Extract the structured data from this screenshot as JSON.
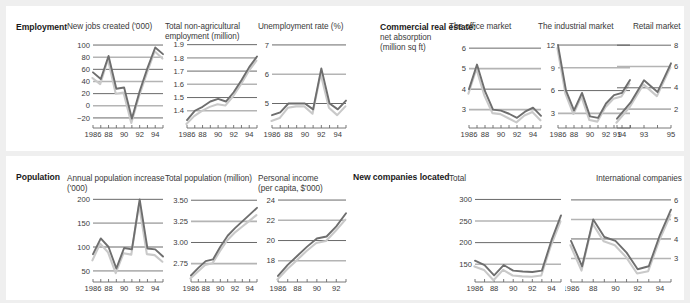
{
  "page": {
    "background": "#efefef",
    "panel_background": "#ffffff",
    "line_color": "#6e6e6e",
    "shadow_color": "#c9c9c9"
  },
  "sections": {
    "employment": {
      "label": "Employment"
    },
    "commercial": {
      "label": "Commercial real estate:",
      "sub1": "net absorption",
      "sub2": "(million sq ft)"
    },
    "population": {
      "label": "Population"
    },
    "companies": {
      "label": "New companies located"
    }
  },
  "chart_data": [
    {
      "id": "new-jobs-created",
      "type": "line",
      "title": "New jobs created ('000)",
      "title_lines": [
        "New jobs created ('000)"
      ],
      "x": [
        1986,
        1987,
        1988,
        1989,
        1990,
        1991,
        1992,
        1993,
        1994,
        1995
      ],
      "xtick_labels": [
        "1986",
        "88",
        "90",
        "92",
        "94"
      ],
      "xtick_values": [
        1986,
        1988,
        1990,
        1992,
        1994
      ],
      "ytick_labels": [
        "100",
        "80",
        "60",
        "40",
        "20",
        "0",
        "−20"
      ],
      "ytick_values": [
        100,
        80,
        60,
        40,
        20,
        0,
        -20
      ],
      "ylim": [
        -30,
        105
      ],
      "grid": true,
      "series": [
        {
          "name": "main",
          "values": [
            55,
            44,
            82,
            28,
            30,
            -21,
            24,
            62,
            96,
            85
          ]
        },
        {
          "name": "shadow",
          "values": [
            48,
            38,
            79,
            22,
            24,
            -26,
            18,
            56,
            92,
            80
          ]
        }
      ]
    },
    {
      "id": "total-non-agricultural-employment",
      "type": "line",
      "title": "Total non-agricultural employment (million)",
      "title_lines": [
        "Total non-agricultural",
        "employment (million)"
      ],
      "x": [
        1986,
        1987,
        1988,
        1989,
        1990,
        1991,
        1992,
        1993,
        1994,
        1995
      ],
      "xtick_labels": [
        "1986",
        "88",
        "90",
        "92",
        "94"
      ],
      "xtick_values": [
        1986,
        1988,
        1990,
        1992,
        1994
      ],
      "ytick_labels": [
        "1.9",
        "1.8",
        "1.7",
        "1.6",
        "1.5",
        "1.4"
      ],
      "ytick_values": [
        1.9,
        1.8,
        1.7,
        1.6,
        1.5,
        1.4
      ],
      "ylim": [
        1.3,
        1.92
      ],
      "grid": true,
      "series": [
        {
          "name": "main",
          "values": [
            1.33,
            1.4,
            1.43,
            1.47,
            1.49,
            1.47,
            1.54,
            1.63,
            1.73,
            1.81
          ]
        },
        {
          "name": "shadow",
          "values": [
            1.31,
            1.37,
            1.41,
            1.44,
            1.46,
            1.45,
            1.52,
            1.61,
            1.71,
            1.79
          ]
        }
      ]
    },
    {
      "id": "unemployment-rate",
      "type": "line",
      "title": "Unemployment rate (%)",
      "title_lines": [
        "Unemployment rate (%)"
      ],
      "x": [
        1986,
        1987,
        1988,
        1989,
        1990,
        1991,
        1992,
        1993,
        1994,
        1995
      ],
      "xtick_labels": [
        "1986",
        "88",
        "90",
        "92",
        "94"
      ],
      "xtick_values": [
        1986,
        1988,
        1990,
        1992,
        1994
      ],
      "ytick_labels": [
        "7",
        "6",
        "5"
      ],
      "ytick_values": [
        7,
        6,
        5
      ],
      "ylim": [
        4.3,
        7.1
      ],
      "grid": true,
      "series": [
        {
          "name": "main",
          "values": [
            4.6,
            4.7,
            5.0,
            5.0,
            5.0,
            4.8,
            6.2,
            5.0,
            4.8,
            5.1
          ]
        },
        {
          "name": "shadow",
          "values": [
            4.45,
            4.55,
            4.9,
            4.95,
            4.95,
            4.7,
            6.05,
            4.9,
            4.65,
            4.95
          ]
        }
      ]
    },
    {
      "id": "office-market",
      "type": "line",
      "title": "The office market",
      "title_lines": [
        "The office market"
      ],
      "x": [
        1986,
        1987,
        1988,
        1989,
        1990,
        1991,
        1992,
        1993,
        1994,
        1995
      ],
      "xtick_labels": [
        "1986",
        "88",
        "90",
        "92",
        "94"
      ],
      "xtick_values": [
        1986,
        1988,
        1990,
        1992,
        1994
      ],
      "ytick_labels": [
        "6",
        "5",
        "4",
        "3"
      ],
      "ytick_values": [
        6,
        5,
        4,
        3
      ],
      "ylim": [
        2.3,
        6.3
      ],
      "grid": true,
      "series": [
        {
          "name": "main",
          "values": [
            4.0,
            5.2,
            3.9,
            3.0,
            2.95,
            2.8,
            2.6,
            2.9,
            3.1,
            2.7
          ]
        },
        {
          "name": "shadow",
          "values": [
            3.85,
            5.05,
            3.75,
            2.9,
            2.85,
            2.65,
            2.45,
            2.78,
            2.95,
            2.55
          ]
        }
      ]
    },
    {
      "id": "industrial-market",
      "type": "line",
      "title": "The industrial market",
      "title_lines": [
        "The industrial market"
      ],
      "x": [
        1986,
        1987,
        1988,
        1989,
        1990,
        1991,
        1992,
        1993,
        1994,
        1995
      ],
      "xtick_labels": [
        "1986",
        "88",
        "90",
        "92",
        "94"
      ],
      "xtick_values": [
        1986,
        1988,
        1990,
        1992,
        1994
      ],
      "ytick_labels": [
        "12",
        "9",
        "6",
        "3"
      ],
      "ytick_values": [
        12,
        9,
        6,
        3
      ],
      "ylim": [
        1.6,
        12.4
      ],
      "grid": true,
      "series": [
        {
          "name": "main",
          "values": [
            12.0,
            6.0,
            3.4,
            5.7,
            2.6,
            2.4,
            4.3,
            5.4,
            5.7,
            7.4
          ]
        },
        {
          "name": "shadow",
          "values": [
            11.8,
            5.8,
            3.1,
            5.4,
            2.3,
            2.1,
            4.0,
            5.1,
            5.4,
            7.1
          ]
        }
      ]
    },
    {
      "id": "retail-market",
      "type": "line",
      "title": "Retail market",
      "title_lines": [
        "Retail market"
      ],
      "x": [
        1991,
        1992,
        1993,
        1994,
        1995
      ],
      "xtick_labels": [
        "91",
        "93",
        "95"
      ],
      "xtick_values": [
        1991,
        1993,
        1995
      ],
      "ytick_labels": [
        "8",
        "6",
        "4",
        "2"
      ],
      "ytick_values": [
        8,
        6,
        4,
        2
      ],
      "ylim": [
        0.6,
        8.3
      ],
      "grid": true,
      "grid_right": true,
      "series": [
        {
          "name": "main",
          "values": [
            1.1,
            2.6,
            4.7,
            3.6,
            6.3
          ]
        },
        {
          "name": "shadow",
          "values": [
            0.85,
            2.35,
            4.45,
            3.35,
            6.05
          ]
        }
      ]
    },
    {
      "id": "annual-population-increase",
      "type": "line",
      "title": "Annual population increase ('000)",
      "title_lines": [
        "Annual population increase",
        "('000)"
      ],
      "x": [
        1986,
        1987,
        1988,
        1989,
        1990,
        1991,
        1992,
        1993,
        1994,
        1995
      ],
      "xtick_labels": [
        "1986",
        "88",
        "90",
        "92",
        "94"
      ],
      "xtick_values": [
        1986,
        1988,
        1990,
        1992,
        1994
      ],
      "ytick_labels": [
        "200",
        "150",
        "100",
        "50"
      ],
      "ytick_values": [
        200,
        150,
        100,
        50
      ],
      "ylim": [
        35,
        207
      ],
      "grid": true,
      "series": [
        {
          "name": "main",
          "values": [
            85,
            118,
            100,
            55,
            98,
            95,
            200,
            97,
            95,
            80
          ]
        },
        {
          "name": "shadow",
          "values": [
            75,
            110,
            92,
            48,
            90,
            87,
            192,
            88,
            86,
            72
          ]
        }
      ]
    },
    {
      "id": "total-population",
      "type": "line",
      "title": "Total population (million)",
      "title_lines": [
        "Total population (million)"
      ],
      "x": [
        1986,
        1987,
        1988,
        1989,
        1990,
        1991,
        1992,
        1993,
        1994,
        1995
      ],
      "xtick_labels": [
        "1986",
        "88",
        "90",
        "92",
        "94"
      ],
      "xtick_values": [
        1986,
        1988,
        1990,
        1992,
        1994
      ],
      "ytick_labels": [
        "3.50",
        "3.25",
        "3.00",
        "2.75"
      ],
      "ytick_values": [
        3.5,
        3.25,
        3.0,
        2.75
      ],
      "ylim": [
        2.58,
        3.55
      ],
      "grid": true,
      "series": [
        {
          "name": "main",
          "values": [
            2.61,
            2.7,
            2.78,
            2.8,
            2.95,
            3.08,
            3.17,
            3.25,
            3.33,
            3.41
          ]
        },
        {
          "name": "shadow",
          "values": [
            2.59,
            2.67,
            2.75,
            2.77,
            2.91,
            3.04,
            3.13,
            3.2,
            3.27,
            3.34
          ]
        }
      ]
    },
    {
      "id": "personal-income",
      "type": "line",
      "title": "Personal income (per capita, $'000)",
      "title_lines": [
        "Personal income",
        "(per capita, $'000)"
      ],
      "x": [
        1986,
        1987,
        1988,
        1989,
        1990,
        1991,
        1992,
        1993
      ],
      "xtick_labels": [
        "1986",
        "88",
        "90",
        "92"
      ],
      "xtick_values": [
        1986,
        1988,
        1990,
        1992
      ],
      "ytick_labels": [
        "24",
        "22",
        "20",
        "18"
      ],
      "ytick_values": [
        24,
        22,
        20,
        18
      ],
      "ylim": [
        16.3,
        24.4
      ],
      "grid": true,
      "series": [
        {
          "name": "main",
          "values": [
            16.5,
            17.6,
            18.5,
            19.4,
            20.2,
            20.4,
            21.4,
            22.7
          ]
        },
        {
          "name": "shadow",
          "values": [
            16.3,
            17.3,
            18.2,
            19.1,
            19.9,
            20.1,
            21.1,
            22.2
          ]
        }
      ]
    },
    {
      "id": "companies-total",
      "type": "line",
      "title": "Total",
      "title_lines": [
        "Total"
      ],
      "x": [
        1986,
        1987,
        1988,
        1989,
        1990,
        1991,
        1992,
        1993,
        1994,
        1995
      ],
      "xtick_labels": [
        "1986",
        "88",
        "90",
        "92",
        "94"
      ],
      "xtick_values": [
        1986,
        1988,
        1990,
        1992,
        1994
      ],
      "ytick_labels": [
        "300",
        "250",
        "200",
        "150"
      ],
      "ytick_values": [
        300,
        250,
        200,
        150
      ],
      "ylim": [
        118,
        308
      ],
      "grid": true,
      "series": [
        {
          "name": "main",
          "values": [
            158,
            148,
            124,
            148,
            135,
            133,
            132,
            135,
            205,
            263
          ]
        },
        {
          "name": "shadow",
          "values": [
            148,
            140,
            116,
            140,
            127,
            125,
            124,
            127,
            196,
            252
          ]
        }
      ]
    },
    {
      "id": "international-companies",
      "type": "line",
      "title": "International companies",
      "title_lines": [
        "International companies"
      ],
      "x": [
        1986,
        1987,
        1988,
        1989,
        1990,
        1991,
        1992,
        1993,
        1994,
        1995
      ],
      "xtick_labels": [
        "1986",
        "88",
        "90",
        "92",
        "94"
      ],
      "xtick_values": [
        1986,
        1988,
        1990,
        1992,
        1994
      ],
      "ytick_labels": [
        "6",
        "5",
        "4",
        "3"
      ],
      "ytick_values": [
        6,
        5,
        4,
        3
      ],
      "ylim": [
        2.0,
        6.2
      ],
      "grid": true,
      "grid_right": true,
      "series": [
        {
          "name": "main",
          "values": [
            3.9,
            2.6,
            5.0,
            4.1,
            3.9,
            3.3,
            2.45,
            2.6,
            4.2,
            5.5
          ]
        },
        {
          "name": "shadow",
          "values": [
            3.75,
            2.45,
            4.85,
            3.95,
            3.75,
            3.15,
            2.3,
            2.42,
            4.0,
            5.3
          ]
        }
      ]
    }
  ]
}
